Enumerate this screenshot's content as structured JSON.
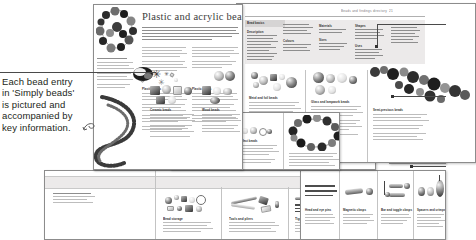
{
  "annotation": {
    "caption_lines": [
      "Each bead entry",
      "in 'Simply beads'",
      "is pictured and",
      "accompanied by",
      "key information."
    ],
    "caption_full": "Each bead entry in 'Simply beads' is pictured and accompanied by key information.",
    "curl_glyph": "↺",
    "leader_color": "#4a4a4a"
  },
  "spreads": {
    "main": {
      "title": "Plastic and acrylic beads",
      "sections": [
        {
          "heading": "Plastic beads"
        },
        {
          "heading": "Plastic pearls"
        },
        {
          "heading": "Resin beads"
        },
        {
          "heading": "Lucite beads"
        }
      ]
    },
    "upper_right": {
      "running_head": "Beads and findings directory",
      "page_number": "21",
      "panel_heading": "Bead basics",
      "panel_columns": [
        {
          "heading": "Description"
        },
        {
          "heading": "Colours"
        },
        {
          "heading": "Materials"
        },
        {
          "heading": "Sizes"
        },
        {
          "heading": "Shapes"
        },
        {
          "heading": "Uses"
        }
      ],
      "sections": [
        {
          "heading": "Metal and foil beads"
        },
        {
          "heading": "Glass and lampwork beads"
        },
        {
          "heading": "Semi-precious beads"
        }
      ]
    },
    "right_small": {
      "running_head": "Beads and findings",
      "page_number": "33",
      "section_heading": "Jump rings"
    },
    "lower_left": {
      "sections": [
        {
          "heading": "Ceramic beads"
        },
        {
          "heading": "Wood beads"
        }
      ]
    },
    "lower_mid": {
      "sections": [
        {
          "heading": "Seed beads"
        },
        {
          "heading": "Bugle beads"
        },
        {
          "heading": "Glass effect beads"
        }
      ]
    },
    "bottom": {
      "sections": [
        {
          "heading": "Bead storage"
        },
        {
          "heading": "Tools and pliers"
        },
        {
          "heading": "Tiger tail and wire"
        },
        {
          "heading": "Head and eye pins"
        },
        {
          "heading": "Magnetic clasps"
        },
        {
          "heading": "Bar and toggle clasps"
        },
        {
          "heading": "Spacers and crimps"
        }
      ]
    }
  },
  "colors": {
    "page_border": "#8c8c8c",
    "panel_fill": "#eceaea",
    "text": "#231f20",
    "faux_text": "#8e8e8e"
  }
}
